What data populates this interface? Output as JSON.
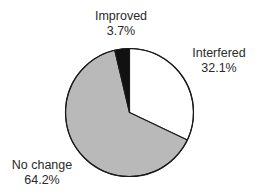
{
  "chart_data": {
    "type": "pie",
    "title": "",
    "start_angle_deg": 0,
    "direction": "clockwise",
    "slices": [
      {
        "label": "Interfered",
        "value": 32.1,
        "value_label": "32.1%",
        "color": "#ffffff"
      },
      {
        "label": "No change",
        "value": 64.2,
        "value_label": "64.2%",
        "color": "#b9b9b9"
      },
      {
        "label": "Improved",
        "value": 3.7,
        "value_label": "3.7%",
        "color": "#111111"
      }
    ],
    "legend": "none",
    "labels_position": "outside",
    "outline_color": "#1a1a1a"
  },
  "labels": {
    "improved": {
      "name": "Improved",
      "pct": "3.7%"
    },
    "interfered": {
      "name": "Interfered",
      "pct": "32.1%"
    },
    "no_change": {
      "name": "No change",
      "pct": "64.2%"
    }
  }
}
